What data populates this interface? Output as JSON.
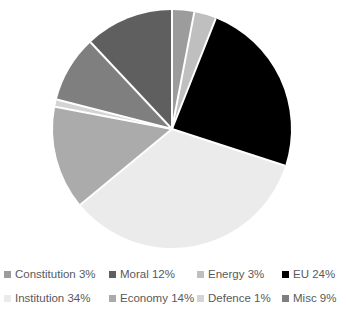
{
  "chart_data": {
    "type": "pie",
    "title": "",
    "categories": [
      "Constitution",
      "Moral",
      "Energy",
      "EU",
      "Institution",
      "Economy",
      "Defence",
      "Misc"
    ],
    "values": [
      3,
      12,
      3,
      24,
      34,
      14,
      1,
      9
    ],
    "labels": [
      "Constitution 3%",
      "Moral 12%",
      "Energy 3%",
      "EU 24%",
      "Institution 34%",
      "Economy 14%",
      "Defence 1%",
      "Misc 9%"
    ],
    "colors": [
      "#9C9C9C",
      "#5F5F5F",
      "#BFBFBF",
      "#000000",
      "#EBEBEB",
      "#ABABAB",
      "#D4D4D4",
      "#7F7F7F"
    ],
    "slice_order_clockwise": [
      "Constitution",
      "Energy",
      "EU",
      "Institution",
      "Economy",
      "Defence",
      "Misc",
      "Moral"
    ],
    "start_angle_deg": 0,
    "legend_position": "bottom",
    "grid": false,
    "xlabel": "",
    "ylabel": ""
  },
  "legend": {
    "rows": [
      [
        {
          "label": "Constitution 3%",
          "color": "#9C9C9C"
        },
        {
          "label": "Moral 12%",
          "color": "#5F5F5F"
        },
        {
          "label": "Energy 3%",
          "color": "#BFBFBF"
        },
        {
          "label": "EU 24%",
          "color": "#000000"
        }
      ],
      [
        {
          "label": "Institution 34%",
          "color": "#EBEBEB"
        },
        {
          "label": "Economy 14%",
          "color": "#ABABAB"
        },
        {
          "label": "Defence 1%",
          "color": "#D4D4D4"
        },
        {
          "label": "Misc 9%",
          "color": "#7F7F7F"
        }
      ]
    ]
  },
  "pie": {
    "center_x": 172,
    "center_y": 129,
    "radius": 119,
    "separator_color": "#FFFFFF",
    "separator_width": 2,
    "slices": [
      {
        "name": "Constitution",
        "percent": 3,
        "color": "#9C9C9C",
        "start_deg": 0.0,
        "end_deg": 10.8
      },
      {
        "name": "Energy",
        "percent": 3,
        "color": "#BFBFBF",
        "start_deg": 10.8,
        "end_deg": 53.1
      },
      {
        "name": "EU",
        "percent": 24,
        "color": "#000000",
        "start_deg": 53.1,
        "end_deg": 64.8
      },
      {
        "name": "Institution",
        "percent": 34,
        "color": "#EBEBEB",
        "start_deg": 64.8,
        "end_deg": 151.2
      },
      {
        "name": "Economy",
        "percent": 14,
        "color": "#ABABAB",
        "start_deg": 151.2,
        "end_deg": 273.6
      },
      {
        "name": "Defence",
        "percent": 1,
        "color": "#D4D4D4",
        "start_deg": 273.6,
        "end_deg": 324.0
      },
      {
        "name": "Misc",
        "percent": 9,
        "color": "#7F7F7F",
        "start_deg": 324.0,
        "end_deg": 327.6
      },
      {
        "name": "Moral",
        "percent": 12,
        "color": "#5F5F5F",
        "start_deg": 327.6,
        "end_deg": 360.0
      }
    ]
  }
}
